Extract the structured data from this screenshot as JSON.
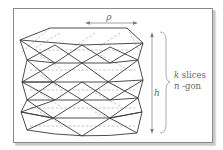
{
  "figure": {
    "labels": {
      "rho": "ρ",
      "h": "h",
      "k_slices_var": "k",
      "k_slices_text": " slices",
      "n_gon_var": "n",
      "n_gon_text": " -gon"
    },
    "colors": {
      "solid_edges": "#3a3a3a",
      "dashed_edges": "#9a9a9a",
      "arrows": "#7a7a7a",
      "text": "#666666",
      "frame": "#8a8a8a"
    }
  }
}
